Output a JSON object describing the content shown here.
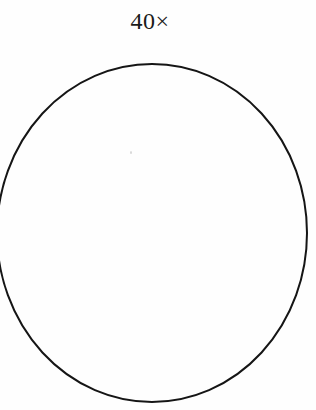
{
  "page": {
    "background_color": "#fefefe",
    "width": 316,
    "height": 410
  },
  "label": {
    "text": "40×",
    "name": "magnification-label",
    "color": "#1b1b1b",
    "align": "center"
  },
  "figure": {
    "name": "circle-outline",
    "shape": "circle",
    "stroke_color": "#151515",
    "stroke_width": 2,
    "fill": "none",
    "center_x": 152,
    "center_y": 233,
    "radius_x": 155,
    "radius_y": 169,
    "clipped_edge": "left"
  },
  "artifacts": {
    "speck": {
      "name": "scan-speck",
      "color": "#d8d8d8",
      "x": 130,
      "y": 151
    }
  },
  "chart_data": {
    "type": "diagram",
    "title": "40×",
    "elements": [
      {
        "kind": "text",
        "value": "40×",
        "x": 149,
        "y": 21
      },
      {
        "kind": "ellipse",
        "cx": 152,
        "cy": 233,
        "rx": 155,
        "ry": 169,
        "stroke": "#151515",
        "stroke_width": 2,
        "fill": "none"
      }
    ],
    "xlabel": "",
    "ylabel": "",
    "legend": [],
    "grid": false
  }
}
